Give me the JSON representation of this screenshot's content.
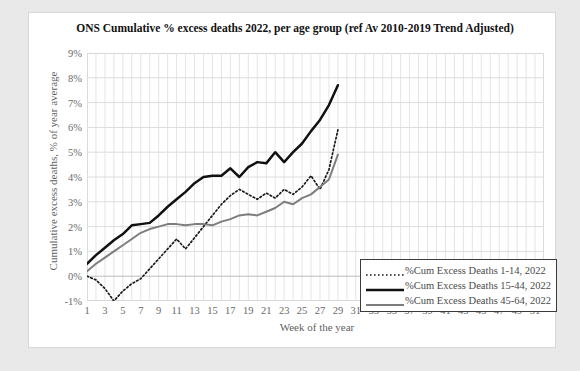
{
  "chart_data": {
    "type": "line",
    "title": "ONS Cumulative % excess deaths 2022, per age group (ref Av 2010-2019 Trend Adjusted)",
    "xlabel": "Week of the year",
    "ylabel": "Cumulative excess deaths, % of year average",
    "grid": true,
    "legend_position": "inside-bottom-right",
    "xlim": [
      1,
      52
    ],
    "ylim": [
      -1,
      9
    ],
    "yticks": [
      "9%",
      "8%",
      "7%",
      "6%",
      "5%",
      "4%",
      "3%",
      "2%",
      "1%",
      "0%",
      "-1%"
    ],
    "ytick_values": [
      9,
      8,
      7,
      6,
      5,
      4,
      3,
      2,
      1,
      0,
      -1
    ],
    "xticks": [
      1,
      3,
      5,
      7,
      9,
      11,
      13,
      15,
      17,
      19,
      21,
      23,
      25,
      27,
      29,
      31,
      33,
      35,
      37,
      39,
      41,
      43,
      45,
      47,
      49,
      51
    ],
    "x": [
      1,
      2,
      3,
      4,
      5,
      6,
      7,
      8,
      9,
      10,
      11,
      12,
      13,
      14,
      15,
      16,
      17,
      18,
      19,
      20,
      21,
      22,
      23,
      24,
      25,
      26,
      27,
      28
    ],
    "series": [
      {
        "name": "%Cum Excess Deaths 1-14, 2022",
        "style": "dotted",
        "color": "#1a1a1a",
        "values": [
          0.0,
          -0.15,
          -0.5,
          -1.0,
          -0.6,
          -0.3,
          -0.1,
          0.3,
          0.7,
          1.1,
          1.5,
          1.1,
          1.55,
          2.0,
          2.45,
          2.9,
          3.25,
          3.5,
          3.3,
          3.1,
          3.35,
          3.15,
          3.5,
          3.3,
          3.6,
          4.05,
          3.5,
          4.3
        ]
      },
      {
        "name": "%Cum Excess Deaths 15-44, 2022",
        "style": "solid-thick",
        "color": "#111111",
        "values": [
          0.5,
          0.85,
          1.15,
          1.45,
          1.7,
          2.05,
          2.1,
          2.15,
          2.45,
          2.8,
          3.1,
          3.4,
          3.75,
          4.0,
          4.05,
          4.05,
          4.35,
          4.0,
          4.4,
          4.6,
          4.55,
          5.0,
          4.6,
          5.0,
          5.35,
          5.85,
          6.3,
          6.9
        ]
      },
      {
        "name": "%Cum Excess Deaths 45-64, 2022",
        "style": "solid-gray",
        "color": "#7d7d7d",
        "values": [
          0.2,
          0.5,
          0.75,
          1.0,
          1.25,
          1.5,
          1.75,
          1.9,
          2.0,
          2.1,
          2.1,
          2.05,
          2.1,
          2.1,
          2.05,
          2.2,
          2.3,
          2.45,
          2.5,
          2.45,
          2.6,
          2.75,
          3.0,
          2.9,
          3.15,
          3.3,
          3.6,
          3.9
        ]
      }
    ],
    "series_tail": {
      "note": "final points continue to week 28",
      "dotted_end": 5.9,
      "black_end": 7.7,
      "gray_end": 4.9
    }
  },
  "legend": {
    "entries": [
      {
        "label": "%Cum Excess Deaths 1-14, 2022",
        "key": "dotted-line-key"
      },
      {
        "label": "%Cum Excess Deaths 15-44, 2022",
        "key": "thick-black-line-key"
      },
      {
        "label": "%Cum Excess Deaths 45-64, 2022",
        "key": "gray-line-key"
      }
    ]
  }
}
